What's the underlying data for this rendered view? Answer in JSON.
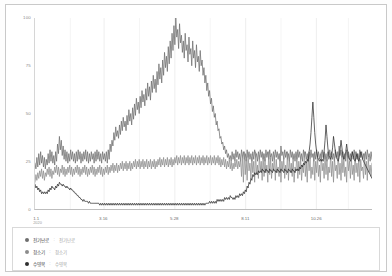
{
  "chart_data": {
    "type": "line",
    "title": "",
    "xlabel": "",
    "ylabel": "",
    "ylim": [
      0,
      100
    ],
    "yticks": [
      0,
      25,
      50,
      75,
      100
    ],
    "ytick_labels": [
      "0",
      "25",
      "50",
      "75",
      "100"
    ],
    "grid": "vertical",
    "legend_position": "bottom",
    "x_axis_start_year": "2020",
    "xtick_labels": [
      "1.1",
      "3.16",
      "5.28",
      "8.11",
      "10.26"
    ],
    "xtick_positions": [
      0,
      0.205,
      0.415,
      0.625,
      0.835
    ],
    "series": [
      {
        "name": "전기난로",
        "value_label": "전기난로",
        "color": "#6e6e6e",
        "values": [
          24,
          21,
          27,
          22,
          29,
          23,
          30,
          24,
          28,
          22,
          27,
          21,
          26,
          23,
          29,
          24,
          31,
          25,
          30,
          24,
          28,
          23,
          30,
          25,
          34,
          29,
          38,
          31,
          36,
          28,
          33,
          26,
          31,
          25,
          30,
          24,
          29,
          25,
          31,
          26,
          30,
          25,
          29,
          24,
          30,
          25,
          31,
          26,
          30,
          24,
          29,
          25,
          30,
          26,
          31,
          25,
          30,
          24,
          29,
          25,
          30,
          26,
          29,
          24,
          30,
          25,
          31,
          26,
          30,
          25,
          29,
          24,
          30,
          26,
          29,
          25,
          30,
          24,
          31,
          26,
          34,
          30,
          36,
          33,
          40,
          36,
          43,
          38,
          41,
          37,
          44,
          39,
          46,
          41,
          48,
          43,
          46,
          41,
          49,
          44,
          52,
          46,
          50,
          44,
          53,
          47,
          55,
          49,
          58,
          52,
          56,
          50,
          59,
          53,
          62,
          56,
          60,
          54,
          63,
          57,
          66,
          59,
          64,
          57,
          67,
          61,
          70,
          63,
          68,
          61,
          72,
          65,
          76,
          68,
          74,
          66,
          78,
          70,
          82,
          74,
          80,
          72,
          85,
          76,
          88,
          79,
          92,
          83,
          96,
          86,
          100,
          90,
          94,
          84,
          97,
          87,
          91,
          82,
          88,
          79,
          92,
          83,
          86,
          77,
          90,
          81,
          84,
          75,
          88,
          79,
          83,
          74,
          86,
          77,
          80,
          72,
          83,
          75,
          78,
          70,
          74,
          66,
          70,
          62,
          66,
          59,
          62,
          55,
          58,
          51,
          54,
          48,
          50,
          44,
          46,
          41,
          42,
          37,
          38,
          34,
          35,
          31,
          33,
          29,
          31,
          27,
          29,
          26,
          28,
          25,
          30,
          26,
          29,
          25,
          31,
          27,
          30,
          26,
          29,
          25,
          31,
          27,
          30,
          26,
          29,
          25,
          31,
          27,
          30,
          26,
          29,
          25,
          30,
          26,
          31,
          27,
          29,
          25,
          30,
          26,
          31,
          27,
          30,
          26,
          29,
          25,
          31,
          27,
          30,
          26,
          31,
          27,
          29,
          25,
          30,
          26,
          31,
          27,
          30,
          26,
          29,
          25,
          33,
          28,
          30,
          26,
          31,
          27,
          30,
          26,
          29,
          25,
          31,
          27,
          30,
          26,
          29,
          25,
          30,
          26,
          31,
          27,
          30,
          26,
          29,
          25,
          31,
          27,
          30,
          26,
          29,
          25,
          30,
          26,
          31,
          27,
          29,
          25,
          30,
          26,
          31,
          27,
          30,
          26,
          29,
          25,
          31,
          27,
          30,
          26,
          29,
          25,
          30,
          26,
          31,
          27,
          30,
          26,
          29,
          25,
          31,
          27,
          30,
          26,
          33,
          28,
          31,
          27,
          30,
          26,
          29,
          25,
          31,
          27,
          30,
          26,
          29,
          25,
          30,
          26,
          31,
          27,
          30,
          26,
          29,
          25,
          31,
          27,
          30,
          26,
          29,
          25,
          30,
          26,
          31,
          27,
          29,
          25,
          30,
          26
        ]
      },
      {
        "name": "청소기",
        "value_label": "청소기",
        "color": "#8c8c8c",
        "values": [
          14,
          18,
          15,
          19,
          16,
          20,
          17,
          21,
          16,
          20,
          15,
          19,
          17,
          21,
          18,
          22,
          17,
          21,
          16,
          20,
          18,
          22,
          19,
          23,
          18,
          22,
          17,
          21,
          19,
          23,
          18,
          22,
          17,
          21,
          18,
          22,
          19,
          23,
          18,
          22,
          17,
          21,
          18,
          22,
          19,
          23,
          18,
          22,
          17,
          21,
          18,
          22,
          19,
          23,
          18,
          22,
          17,
          21,
          18,
          22,
          19,
          23,
          18,
          22,
          17,
          21,
          18,
          22,
          19,
          23,
          18,
          22,
          17,
          21,
          18,
          22,
          19,
          23,
          18,
          22,
          19,
          23,
          20,
          24,
          19,
          23,
          20,
          24,
          19,
          23,
          20,
          24,
          21,
          25,
          20,
          24,
          21,
          25,
          20,
          24,
          21,
          25,
          20,
          24,
          21,
          25,
          22,
          26,
          21,
          25,
          22,
          26,
          21,
          25,
          22,
          26,
          21,
          25,
          22,
          26,
          21,
          25,
          22,
          26,
          21,
          25,
          22,
          26,
          21,
          25,
          22,
          26,
          23,
          27,
          22,
          26,
          23,
          27,
          22,
          26,
          23,
          27,
          22,
          26,
          23,
          27,
          22,
          26,
          23,
          27,
          24,
          28,
          23,
          27,
          24,
          28,
          23,
          27,
          24,
          28,
          23,
          27,
          24,
          28,
          23,
          27,
          24,
          28,
          23,
          27,
          24,
          28,
          23,
          27,
          24,
          28,
          23,
          27,
          24,
          28,
          23,
          27,
          24,
          28,
          23,
          27,
          24,
          28,
          23,
          27,
          24,
          28,
          23,
          27,
          24,
          28,
          23,
          27,
          22,
          26,
          23,
          27,
          22,
          26,
          21,
          25,
          22,
          26,
          21,
          25,
          20,
          24,
          21,
          25,
          22,
          26,
          21,
          25,
          22,
          26,
          17,
          28,
          14,
          30,
          18,
          26,
          15,
          29,
          20,
          24,
          16,
          27,
          19,
          25,
          14,
          30,
          18,
          23,
          16,
          28,
          20,
          25,
          15,
          29,
          17,
          26,
          19,
          23,
          14,
          30,
          18,
          27,
          16,
          24,
          20,
          28,
          15,
          26,
          19,
          22,
          17,
          29,
          14,
          25,
          20,
          27,
          16,
          23,
          18,
          30,
          15,
          26,
          19,
          24,
          17,
          28,
          14,
          22,
          20,
          29,
          16,
          25,
          18,
          27,
          15,
          23,
          19,
          30,
          17,
          24,
          14,
          28,
          20,
          26,
          16,
          22,
          18,
          29,
          15,
          25,
          19,
          27,
          17,
          23,
          14,
          30,
          20,
          24,
          16,
          28,
          18,
          26,
          15,
          22,
          19,
          29,
          17,
          25,
          14,
          27,
          20,
          23,
          16,
          30,
          18,
          24,
          15,
          28,
          19,
          26,
          17,
          22,
          14,
          29,
          20,
          25,
          16,
          27,
          18,
          23,
          15,
          30,
          19,
          24,
          17,
          28,
          14,
          26,
          20,
          22,
          16,
          29,
          18,
          25,
          15,
          27,
          19,
          23,
          17,
          24
        ]
      },
      {
        "name": "수영복",
        "value_label": "수영복",
        "color": "#2f2f2f",
        "values": [
          13,
          11,
          12,
          10,
          11,
          9,
          10,
          8,
          9,
          8,
          9,
          8,
          9,
          8,
          10,
          9,
          11,
          10,
          12,
          11,
          11,
          10,
          12,
          11,
          13,
          12,
          14,
          13,
          13,
          12,
          13,
          12,
          12,
          11,
          12,
          11,
          11,
          10,
          11,
          10,
          10,
          9,
          9,
          8,
          8,
          7,
          7,
          6,
          6,
          5,
          5,
          4,
          5,
          4,
          4,
          4,
          4,
          3,
          4,
          3,
          3,
          3,
          3,
          3,
          3,
          3,
          3,
          3,
          3,
          2,
          3,
          2,
          3,
          2,
          3,
          2,
          3,
          2,
          3,
          2,
          3,
          2,
          3,
          2,
          3,
          2,
          3,
          2,
          3,
          2,
          3,
          2,
          3,
          2,
          3,
          2,
          3,
          2,
          3,
          2,
          3,
          2,
          3,
          2,
          3,
          2,
          3,
          2,
          3,
          2,
          3,
          2,
          3,
          2,
          3,
          2,
          3,
          2,
          3,
          2,
          3,
          2,
          3,
          2,
          3,
          2,
          3,
          2,
          3,
          2,
          3,
          2,
          3,
          2,
          3,
          2,
          3,
          2,
          3,
          2,
          3,
          2,
          3,
          2,
          3,
          2,
          3,
          2,
          3,
          2,
          3,
          2,
          3,
          2,
          3,
          2,
          3,
          2,
          3,
          2,
          3,
          2,
          3,
          2,
          3,
          2,
          3,
          2,
          3,
          2,
          3,
          2,
          3,
          2,
          3,
          2,
          3,
          2,
          3,
          2,
          3,
          2,
          3,
          3,
          3,
          3,
          4,
          3,
          4,
          3,
          4,
          3,
          4,
          3,
          5,
          4,
          5,
          4,
          5,
          4,
          5,
          4,
          6,
          5,
          6,
          5,
          6,
          5,
          7,
          6,
          6,
          5,
          6,
          5,
          7,
          6,
          7,
          6,
          8,
          7,
          8,
          7,
          9,
          8,
          10,
          9,
          12,
          11,
          14,
          13,
          16,
          15,
          18,
          17,
          19,
          18,
          19,
          18,
          20,
          19,
          20,
          19,
          21,
          20,
          20,
          19,
          21,
          20,
          20,
          19,
          21,
          20,
          20,
          19,
          21,
          20,
          20,
          19,
          21,
          20,
          20,
          19,
          21,
          20,
          20,
          19,
          21,
          20,
          20,
          19,
          21,
          20,
          20,
          19,
          21,
          20,
          20,
          19,
          21,
          20,
          21,
          20,
          22,
          21,
          23,
          22,
          24,
          23,
          25,
          24,
          26,
          25,
          30,
          34,
          40,
          48,
          56,
          48,
          40,
          34,
          30,
          27,
          26,
          25,
          26,
          25,
          26,
          25,
          30,
          36,
          44,
          38,
          32,
          28,
          27,
          26,
          28,
          32,
          38,
          34,
          30,
          27,
          26,
          25,
          27,
          31,
          36,
          32,
          28,
          26,
          27,
          30,
          34,
          30,
          27,
          26,
          25,
          27,
          30,
          28,
          26,
          25,
          27,
          29,
          26,
          25,
          27,
          30,
          28,
          26,
          25,
          24,
          23,
          22,
          21,
          20,
          19,
          18,
          17,
          16
        ]
      }
    ]
  }
}
